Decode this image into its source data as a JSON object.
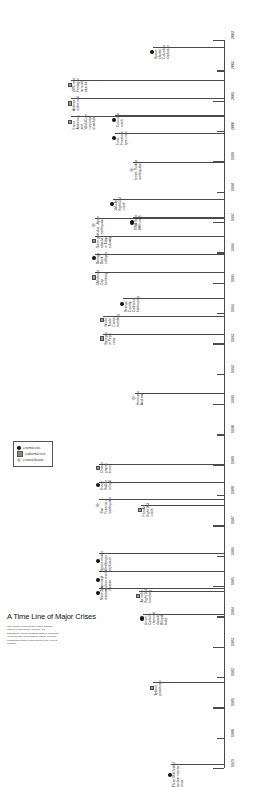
{
  "title": "A Time Line of Major Crises",
  "description": "The number of accidental crises, whether natural or man-made (normal), are increasingly being overshadowed by abnormal (or deliberately precipitated) crises. Yet most companies remain unprepared for any kind of calamity.",
  "legend": {
    "items": [
      {
        "marker": "normal",
        "label": "= normal crisis"
      },
      {
        "marker": "abnormal",
        "label": "= abnormal  crisis"
      },
      {
        "marker": "natural",
        "label": "= natural disaster"
      }
    ]
  },
  "axis": {
    "years": [
      "1979",
      "1980",
      "1981",
      "1982",
      "1983",
      "1984",
      "1985",
      "1986",
      "1987",
      "1988",
      "1989",
      "1990",
      "1991",
      "1992",
      "1993",
      "1994",
      "1995",
      "1996",
      "1997",
      "1998",
      "1999",
      "2000",
      "2001",
      "2002",
      "2003"
    ],
    "start_year": 1979,
    "end_year": 2003
  },
  "events": [
    {
      "year": 1979,
      "label": "Three Mile Island\nnuclear reactor\ncrisis",
      "type": "normal"
    },
    {
      "year": 1982,
      "label": "Tylenol\npoisonings",
      "type": "abnormal"
    },
    {
      "year": 1984,
      "label": "Union\nCarbide\nchemical\ndisaster,\nBhopal,\nIndia",
      "type": "normal"
    },
    {
      "year": 1985,
      "label": "Air India\nflight 182\nbombing",
      "type": "abnormal"
    },
    {
      "year": 1986,
      "label": "Space shuttle\nChallenger\nexplosion",
      "type": "normal"
    },
    {
      "year": 1986,
      "label": "Chernobyl\nnuclear reactor\ndisaster",
      "type": "normal"
    },
    {
      "year": 1987,
      "label": "Mad Cow\ndisease",
      "type": "normal"
    },
    {
      "year": 1988,
      "label": "Pan Am\nflight 103\ncrash",
      "type": "abnormal"
    },
    {
      "year": 1989,
      "label": "Chilean\ngrapes\nscare",
      "type": "abnormal"
    },
    {
      "year": 1989,
      "label": "Exxon\nValdez\noil spill",
      "type": "normal"
    },
    {
      "year": 1989,
      "label": "San\nFrancisco\nearthquake",
      "type": "natural"
    },
    {
      "year": 1992,
      "label": "Hurricane\nAndrew",
      "type": "natural"
    },
    {
      "year": 1993,
      "label": "World\nTrade\nCenter\nbombing",
      "type": "abnormal"
    },
    {
      "year": 1993,
      "label": "Syringes\nin Pepsi\ncans",
      "type": "abnormal"
    },
    {
      "year": 1994,
      "label": "Orange\nCounty,\nCalifornia,\nbankruptcy",
      "type": "normal"
    },
    {
      "year": 1995,
      "label": "Barings\nBank\ncollapse",
      "type": "normal"
    },
    {
      "year": 1995,
      "label": "Oklahoma\nCity\nbombing",
      "type": "abnormal"
    },
    {
      "year": 1995,
      "label": "Sarin gas\nattacks\nin Tokyo\nsubway",
      "type": "abnormal"
    },
    {
      "year": 1995,
      "label": "Kobe, Japan\nearthquake",
      "type": "natural"
    },
    {
      "year": 1996,
      "label": "ValuJet\nflight 592\ncrash",
      "type": "normal"
    },
    {
      "year": 1996,
      "label": "TWA flight\n800 crash",
      "type": "normal"
    },
    {
      "year": 1999,
      "label": "Izmet, Turkey\nearthquake",
      "type": "natural"
    },
    {
      "year": 2000,
      "label": "Concorde\ncrash",
      "type": "normal"
    },
    {
      "year": 2000,
      "label": "Ford-\nFirestone\ntyre crisis",
      "type": "normal"
    },
    {
      "year": 2001,
      "label": "WTC and\nPentagon\nterrorist\nattacks",
      "type": "abnormal"
    },
    {
      "year": 2001,
      "label": "Anthrax\nin the mail",
      "type": "abnormal"
    },
    {
      "year": 2001,
      "label": "Enron,\nAndersen,\nand\nWorldCom\ncorporate\nscandals",
      "type": "abnormal"
    },
    {
      "year": 2003,
      "label": "Space\nshuttle\nColumbia\nexplosion",
      "type": "normal"
    }
  ],
  "event_layout": [
    {
      "top": 762,
      "line": 14,
      "left": 168
    },
    {
      "top": 680,
      "line": 18,
      "left": 150
    },
    {
      "top": 612,
      "line": 16,
      "left": 140
    },
    {
      "top": 589,
      "line": 28,
      "left": 136
    },
    {
      "top": 551,
      "line": 86,
      "left": 96
    },
    {
      "top": 569,
      "line": 86,
      "left": 96
    },
    {
      "top": 586,
      "line": 86,
      "left": 96
    },
    {
      "top": 503,
      "line": 26,
      "left": 138
    },
    {
      "top": 462,
      "line": 88,
      "left": 96
    },
    {
      "top": 480,
      "line": 88,
      "left": 96
    },
    {
      "top": 497,
      "line": 88,
      "left": 96
    },
    {
      "top": 391,
      "line": 36,
      "left": 132
    },
    {
      "top": 314,
      "line": 84,
      "left": 100
    },
    {
      "top": 332,
      "line": 84,
      "left": 100
    },
    {
      "top": 296,
      "line": 62,
      "left": 120
    },
    {
      "top": 252,
      "line": 96,
      "left": 92
    },
    {
      "top": 270,
      "line": 96,
      "left": 92
    },
    {
      "top": 234,
      "line": 96,
      "left": 92
    },
    {
      "top": 216,
      "line": 96,
      "left": 92
    },
    {
      "top": 197,
      "line": 82,
      "left": 110
    },
    {
      "top": 215,
      "line": 62,
      "left": 130
    },
    {
      "top": 160,
      "line": 68,
      "left": 130
    },
    {
      "top": 113,
      "line": 84,
      "left": 112
    },
    {
      "top": 131,
      "line": 84,
      "left": 112
    },
    {
      "top": 78,
      "line": 128,
      "left": 68
    },
    {
      "top": 96,
      "line": 128,
      "left": 68
    },
    {
      "top": 114,
      "line": 128,
      "left": 68
    },
    {
      "top": 45,
      "line": 50,
      "left": 150
    }
  ]
}
